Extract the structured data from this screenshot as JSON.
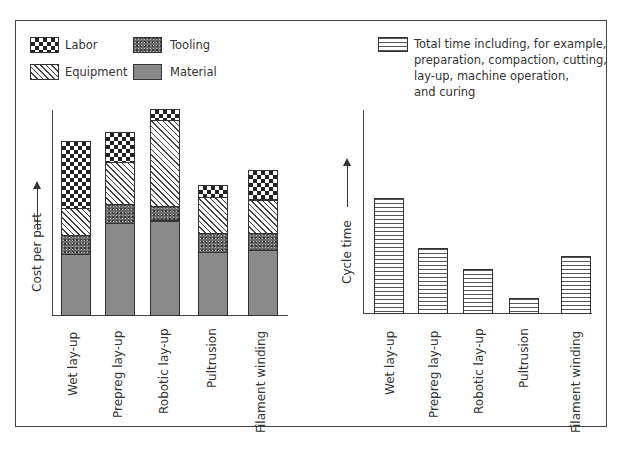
{
  "chart_data": [
    {
      "type": "bar",
      "stacked": true,
      "title": "",
      "xlabel": "",
      "ylabel": "Cost per part",
      "ylim": [
        0,
        100
      ],
      "grid": false,
      "legend_position": "top-left",
      "categories": [
        "Wet lay-up",
        "Prepreg lay-up",
        "Robotic lay-up",
        "Pultrusion",
        "Filament winding"
      ],
      "series": [
        {
          "name": "Material",
          "pattern": "solid-gray",
          "values": [
            29,
            44,
            45,
            30,
            31
          ]
        },
        {
          "name": "Tooling",
          "pattern": "stipple-dark",
          "values": [
            9,
            9,
            7,
            9,
            8
          ]
        },
        {
          "name": "Equipment",
          "pattern": "diagonal-hatch",
          "values": [
            13,
            20,
            41,
            17,
            16
          ]
        },
        {
          "name": "Labor",
          "pattern": "checkerboard",
          "values": [
            32,
            14,
            5,
            6,
            14
          ]
        }
      ],
      "note": "Relative units; no numeric ticks shown on axis"
    },
    {
      "type": "bar",
      "title": "",
      "xlabel": "",
      "ylabel": "Cycle time",
      "ylim": [
        0,
        100
      ],
      "grid": false,
      "legend_position": "top-right",
      "categories": [
        "Wet lay-up",
        "Prepreg lay-up",
        "Robotic lay-up",
        "Pultrusion",
        "Filament winding"
      ],
      "series": [
        {
          "name": "Total time including, for example, preparation, compaction, cutting, lay-up, machine operation, and curing",
          "pattern": "horizontal-lines",
          "values": [
            55,
            31,
            21,
            7,
            27
          ]
        }
      ],
      "note": "Relative units; no numeric ticks shown on axis"
    }
  ],
  "legend_left": {
    "labor": "Labor",
    "tooling": "Tooling",
    "equipment": "Equipment",
    "material": "Material"
  },
  "legend_right": {
    "lines": [
      "Total time including, for example,",
      "preparation, compaction, cutting,",
      "lay-up, machine operation,",
      "and curing"
    ]
  },
  "left_chart": {
    "ylabel": "Cost per part",
    "categories": [
      "Wet lay-up",
      "Prepreg lay-up",
      "Robotic lay-up",
      "Pultrusion",
      "Filament winding"
    ]
  },
  "right_chart": {
    "ylabel": "Cycle time",
    "categories": [
      "Wet lay-up",
      "Prepreg lay-up",
      "Robotic lay-up",
      "Pultrusion",
      "Filament winding"
    ]
  }
}
